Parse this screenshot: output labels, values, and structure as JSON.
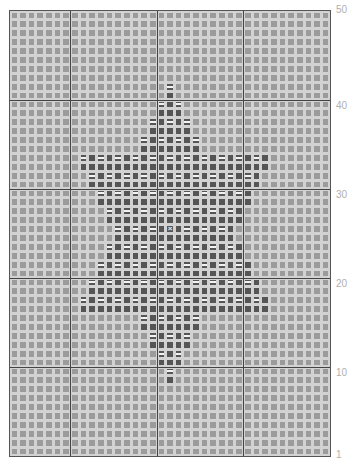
{
  "chart_title": "",
  "grid": {
    "columns": 37,
    "rows": 50,
    "major_every": 10,
    "major_col_lines": [
      7,
      17,
      27
    ],
    "colors": {
      "background_cell": "#9b9b9b",
      "motif_cell": "#555555",
      "gridline": "#d2d2d2",
      "major_line": "#444444",
      "dash_mark": "#f2f2f2",
      "label": "#b0b0b0"
    }
  },
  "row_labels": [
    {
      "row": 50,
      "text": "50"
    },
    {
      "row": 40,
      "text": "40"
    },
    {
      "row": 30,
      "text": "30"
    },
    {
      "row": 20,
      "text": "20"
    },
    {
      "row": 10,
      "text": "10"
    },
    {
      "row": 1,
      "text": "1"
    }
  ],
  "motif": {
    "name": "star",
    "rows": {
      "42": [
        18,
        18
      ],
      "41": [
        18,
        18
      ],
      "40": [
        17,
        19
      ],
      "39": [
        17,
        19
      ],
      "38": [
        16,
        20
      ],
      "37": [
        16,
        20
      ],
      "36": [
        15,
        21
      ],
      "35": [
        15,
        21
      ],
      "34": [
        8,
        29
      ],
      "33": [
        8,
        29
      ],
      "32": [
        9,
        28
      ],
      "31": [
        9,
        28
      ],
      "30": [
        10,
        27
      ],
      "29": [
        10,
        27
      ],
      "28": [
        11,
        26
      ],
      "27": [
        11,
        26
      ],
      "26": [
        12,
        25
      ],
      "25": [
        12,
        25
      ],
      "24": [
        11,
        26
      ],
      "23": [
        11,
        26
      ],
      "22": [
        10,
        27
      ],
      "21": [
        10,
        27
      ],
      "20": [
        9,
        28
      ],
      "19": [
        9,
        28
      ],
      "18": [
        8,
        29
      ],
      "17": [
        8,
        29
      ],
      "16": [
        15,
        21
      ],
      "15": [
        15,
        21
      ],
      "14": [
        16,
        20
      ],
      "13": [
        16,
        20
      ],
      "12": [
        17,
        19
      ],
      "11": [
        17,
        19
      ],
      "10": [
        18,
        18
      ],
      "9": [
        18,
        18
      ]
    },
    "dash_rule": "even rows, every other stitch starting at row's first motif stitch",
    "center_mark": {
      "row": 26,
      "col": 18,
      "symbol": "×"
    }
  }
}
